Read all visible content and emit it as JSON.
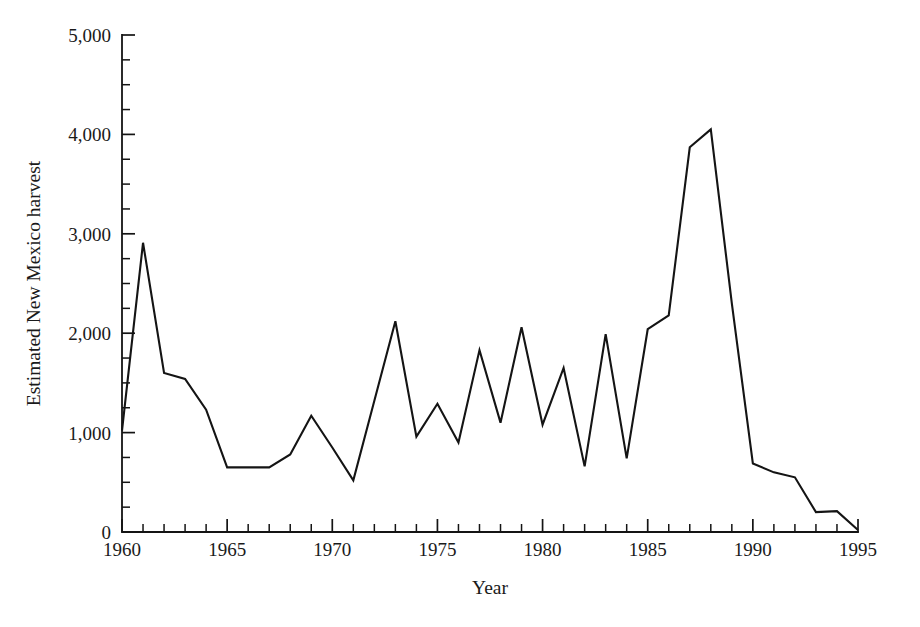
{
  "chart_data": {
    "type": "line",
    "title": "",
    "xlabel": "Year",
    "ylabel": "Estimated New Mexico harvest",
    "xlim": [
      1960,
      1995
    ],
    "ylim": [
      0,
      5000
    ],
    "grid": false,
    "legend": null,
    "x_major_ticks": [
      1960,
      1965,
      1970,
      1975,
      1980,
      1985,
      1990,
      1995
    ],
    "x_major_tick_labels": [
      "1960",
      "1965",
      "1970",
      "1975",
      "1980",
      "1985",
      "1990",
      "1995"
    ],
    "x_minor_tick_step": 1,
    "y_major_ticks": [
      0,
      1000,
      2000,
      3000,
      4000,
      5000
    ],
    "y_major_tick_labels": [
      "0",
      "1,000",
      "2,000",
      "3,000",
      "4,000",
      "5,000"
    ],
    "y_minor_tick_step": 250,
    "line_color": "#141414",
    "x": [
      1960,
      1961,
      1962,
      1963,
      1964,
      1965,
      1966,
      1967,
      1968,
      1969,
      1970,
      1971,
      1972,
      1973,
      1974,
      1975,
      1976,
      1977,
      1978,
      1979,
      1980,
      1981,
      1982,
      1983,
      1984,
      1985,
      1986,
      1987,
      1988,
      1989,
      1990,
      1991,
      1992,
      1993,
      1994,
      1995
    ],
    "values": [
      1020,
      2910,
      1600,
      1540,
      1230,
      650,
      650,
      650,
      780,
      1170,
      850,
      520,
      1320,
      2120,
      960,
      1290,
      900,
      1830,
      1100,
      2060,
      1080,
      1650,
      660,
      1990,
      740,
      2040,
      2180,
      3870,
      4050,
      2300,
      690,
      600,
      550,
      200,
      210,
      20
    ],
    "series_name": "Estimated New Mexico harvest"
  },
  "axis": {
    "x_label": "Year",
    "y_label": "Estimated New Mexico harvest"
  }
}
